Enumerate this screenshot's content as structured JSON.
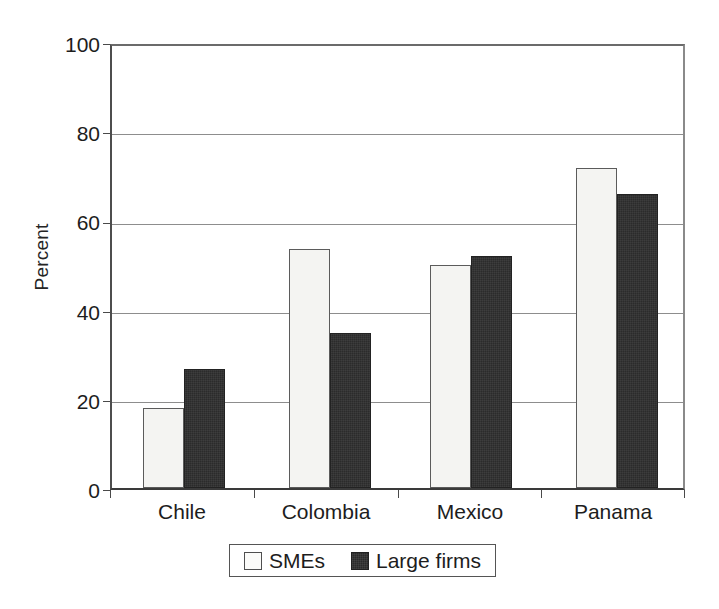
{
  "chart_data": {
    "type": "bar",
    "title": "",
    "subtitle": "",
    "xlabel": "",
    "ylabel": "Percent",
    "categories": [
      "Chile",
      "Colombia",
      "Mexico",
      "Panama"
    ],
    "series": [
      {
        "name": "SMEs",
        "color": "#f4f4f2",
        "values": [
          18,
          54,
          50.5,
          72.5
        ]
      },
      {
        "name": "Large firms",
        "color": "#2b2b2b",
        "values": [
          27,
          35,
          52.5,
          66.5
        ]
      }
    ],
    "ylim": [
      0,
      100
    ],
    "yticks": [
      0,
      20,
      40,
      60,
      80,
      100
    ],
    "ytick_labels": [
      "0",
      "20",
      "40",
      "60",
      "80",
      "100"
    ],
    "grid": "horizontal",
    "legend_position": "bottom-center",
    "legend_entries": [
      "SMEs",
      "Large firms"
    ]
  }
}
